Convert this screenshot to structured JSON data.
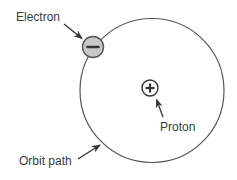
{
  "diagram": {
    "type": "atom-model",
    "labels": {
      "electron": "Electron",
      "proton": "Proton",
      "orbit": "Orbit path"
    },
    "symbols": {
      "electron": "−",
      "proton": "+"
    },
    "colors": {
      "stroke": "#555555",
      "electron_fill": "#c8c8c8",
      "proton_fill": "#ffffff",
      "text": "#3a3a3a",
      "arrow": "#333333"
    }
  }
}
